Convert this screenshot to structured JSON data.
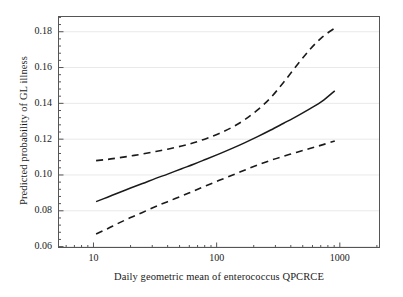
{
  "chart_data": {
    "type": "line",
    "title": "",
    "xlabel": "Daily geometric mean of enterococcus QPCRCE",
    "ylabel": "Predicted probability of GL illness",
    "xscale": "log",
    "yscale": "linear",
    "xlim": [
      5.2,
      2100
    ],
    "ylim": [
      0.0595,
      0.1885
    ],
    "grid": "horizontal",
    "legend": "none",
    "xticks": [
      10,
      100,
      1000
    ],
    "xtick_labels": [
      "10",
      "100",
      "1000"
    ],
    "yticks": [
      0.06,
      0.08,
      0.1,
      0.12,
      0.14,
      0.16,
      0.18
    ],
    "ytick_labels": [
      "0.06",
      "0.08",
      "0.10",
      "0.12",
      "0.14",
      "0.16",
      "0.18"
    ],
    "minor_ticks": "log-decade subdivisions on x, 5 subdivisions per major interval on y",
    "series": [
      {
        "name": "Upper 95% confidence limit",
        "style": "dashed",
        "color": "#1a1a1a",
        "x": [
          10.5,
          13,
          16,
          20,
          25,
          32,
          40,
          52,
          65,
          82,
          105,
          135,
          170,
          215,
          275,
          350,
          450,
          570,
          720,
          910
        ],
        "values": [
          0.108,
          0.1087,
          0.1096,
          0.1106,
          0.1117,
          0.1131,
          0.1144,
          0.1162,
          0.118,
          0.1203,
          0.1232,
          0.1268,
          0.131,
          0.1363,
          0.1432,
          0.1518,
          0.1614,
          0.17,
          0.177,
          0.182
        ]
      },
      {
        "name": "Predicted probability",
        "style": "solid",
        "color": "#1a1a1a",
        "x": [
          10.5,
          13,
          16,
          20,
          25,
          32,
          40,
          52,
          65,
          82,
          105,
          135,
          170,
          215,
          275,
          350,
          450,
          570,
          720,
          910
        ],
        "values": [
          0.0851,
          0.0876,
          0.0901,
          0.0927,
          0.0952,
          0.0981,
          0.1005,
          0.1035,
          0.106,
          0.1088,
          0.1118,
          0.115,
          0.1181,
          0.1214,
          0.1251,
          0.1289,
          0.1329,
          0.1369,
          0.1412,
          0.147
        ]
      },
      {
        "name": "Lower 95% confidence limit",
        "style": "dashed",
        "color": "#1a1a1a",
        "x": [
          10.5,
          13,
          16,
          20,
          25,
          32,
          40,
          52,
          65,
          82,
          105,
          135,
          170,
          215,
          275,
          350,
          450,
          570,
          720,
          910
        ],
        "values": [
          0.067,
          0.07,
          0.0731,
          0.0762,
          0.0791,
          0.0824,
          0.0851,
          0.0883,
          0.091,
          0.094,
          0.097,
          0.1,
          0.1028,
          0.1055,
          0.1082,
          0.1105,
          0.1127,
          0.1148,
          0.1168,
          0.119
        ]
      }
    ]
  },
  "axes": {
    "x_label": "Daily geometric mean of enterococcus QPCRCE",
    "y_label": "Predicted probability of GL illness"
  }
}
